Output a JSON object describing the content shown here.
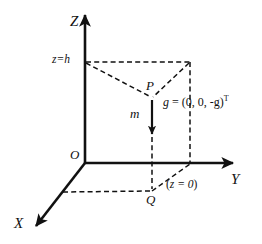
{
  "figure": {
    "background_color": "#ffffff",
    "line_color": "#111111",
    "axes": {
      "z_label": "Z",
      "y_label": "Y",
      "x_label": "X",
      "origin_label": "O"
    },
    "annotations": {
      "height_label": "z=h",
      "point_p": "P",
      "point_q": "Q",
      "mass_label": "m",
      "plane_label_open": "(",
      "plane_label": "z = 0",
      "plane_label_close": ")",
      "gravity_lhs": "g",
      "gravity_eq": " = ",
      "gravity_rhs": "(0, 0, -g)",
      "gravity_transpose": "T"
    },
    "geometry": {
      "origin": [
        85,
        163
      ],
      "z_axis_tip": [
        85,
        12
      ],
      "y_axis_tip": [
        236,
        163
      ],
      "x_axis_tip": [
        33,
        229
      ],
      "z_h_level_y": 62,
      "far_corner": [
        190,
        62
      ],
      "point_p": [
        152,
        98
      ],
      "point_q": [
        152,
        190
      ],
      "arrow_tip": [
        152,
        137
      ],
      "ground_dash_y": 192
    }
  }
}
